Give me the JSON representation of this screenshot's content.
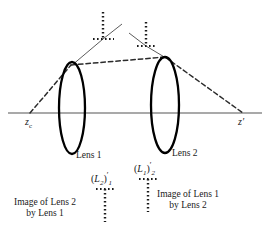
{
  "figure": {
    "kind": "optics-ray-diagram",
    "background_color": "#ffffff",
    "axis_color": "#8c8c8c",
    "lens_color": "#000000",
    "ray_color": "#2b2b2b",
    "dotted_color": "#1a1a1a",
    "text_color": "#1a1a1a"
  },
  "axis": {
    "left_label_main": "z",
    "left_label_sub": "c",
    "right_label": "z′"
  },
  "lenses": [
    {
      "id": "lens-1",
      "label": "Lens 1"
    },
    {
      "id": "lens-2",
      "label": "Lens 2"
    }
  ],
  "image_markers": [
    {
      "id": "image-of-lens-2-by-lens-1",
      "symbol_open": "(",
      "symbol_letter": "L",
      "symbol_letter_sub": "2",
      "symbol_close": ")",
      "symbol_prime": "′",
      "symbol_outer_sub": "1",
      "caption_line_1": "Image of Lens 2",
      "caption_line_2": "by Lens 1"
    },
    {
      "id": "image-of-lens-1-by-lens-2",
      "symbol_open": "(",
      "symbol_letter": "L",
      "symbol_letter_sub": "1",
      "symbol_close": ")",
      "symbol_prime": "′",
      "symbol_outer_sub": "2",
      "caption_line_1": "Image of Lens 1",
      "caption_line_2": "by Lens 2"
    }
  ],
  "geometry": {
    "axis_y": 113,
    "axis_x1": 8,
    "axis_x2": 262,
    "lens1_cx": 72,
    "lens1_cy": 108,
    "lens1_rx": 13,
    "lens1_ry": 46,
    "lens2_cx": 165,
    "lens2_cy": 105,
    "lens2_rx": 14,
    "lens2_ry": 48,
    "zc_x": 32,
    "zprime_x": 241,
    "object_top_x": 103,
    "object_top_y": 12,
    "object_base_y": 39,
    "object2_top_x": 146,
    "object2_top_y": 22,
    "object2_base_y": 46,
    "marker1_x": 105,
    "marker1_y_top": 188,
    "marker1_y_bot": 222,
    "marker2_x": 148,
    "marker2_y_top": 178,
    "marker2_y_bot": 212
  }
}
